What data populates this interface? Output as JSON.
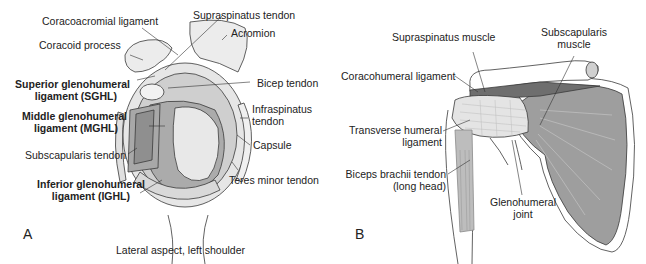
{
  "panel_a": {
    "letter": "A",
    "caption": "Lateral aspect, left shoulder",
    "labels": {
      "coracoacromial_ligament": "Coracoacromial ligament",
      "coracoid_process": "Coracoid process",
      "sghl_line1": "Superior glenohumeral",
      "sghl_line2": "ligament (SGHL)",
      "mghl_line1": "Middle glenohumeral",
      "mghl_line2": "ligament (MGHL)",
      "subscapularis_tendon": "Subscapularis tendon",
      "ighl_line1": "Inferior glenohumeral",
      "ighl_line2": "ligament (IGHL)",
      "supraspinatus_tendon": "Supraspinatus tendon",
      "acromion": "Acromion",
      "bicep_tendon": "Bicep tendon",
      "infraspinatus_line1": "Infraspinatus",
      "infraspinatus_line2": "tendon",
      "capsule": "Capsule",
      "teres_minor_tendon": "Teres minor tendon"
    }
  },
  "panel_b": {
    "letter": "B",
    "labels": {
      "supraspinatus_muscle": "Supraspinatus muscle",
      "subscapularis_line1": "Subscapularis",
      "subscapularis_line2": "muscle",
      "coracohumeral_ligament": "Coracohumeral ligament",
      "transverse_line1": "Transverse humeral",
      "transverse_line2": "ligament",
      "biceps_line1": "Biceps brachii tendon",
      "biceps_line2": "(long head)",
      "glenohumeral_line1": "Glenohumeral",
      "glenohumeral_line2": "joint"
    }
  },
  "colors": {
    "outline": "#3a3a3a",
    "light_fill": "#ececec",
    "mid_fill": "#c8c8c8",
    "dark_fill": "#a0a0a0",
    "muscle_fill": "#9e9e9e",
    "muscle_dark": "#777777"
  }
}
